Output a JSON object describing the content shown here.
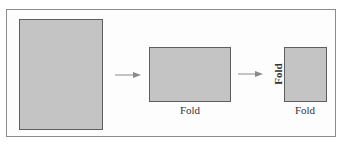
{
  "diagram": {
    "type": "paper-folding-sequence",
    "steps": [
      {
        "id": "full-sheet",
        "shape": "tall rectangle",
        "labels": []
      },
      {
        "id": "folded-once",
        "shape": "wide rectangle",
        "labels": {
          "bottom": "Fold"
        }
      },
      {
        "id": "folded-twice",
        "shape": "small rectangle",
        "labels": {
          "left": "Fold",
          "bottom": "Fold"
        }
      }
    ],
    "arrows": [
      {
        "from": "full-sheet",
        "to": "folded-once"
      },
      {
        "from": "folded-once",
        "to": "folded-twice"
      }
    ],
    "colors": {
      "sheet_fill": "#c4c4c4",
      "sheet_border": "#5e5e5e",
      "frame_border": "#8c8c8c",
      "arrow": "#8a8a8a",
      "text": "#333333"
    }
  },
  "labels": {
    "fold_1_bottom": "Fold",
    "fold_2_left": "Fold",
    "fold_2_bottom": "Fold"
  }
}
